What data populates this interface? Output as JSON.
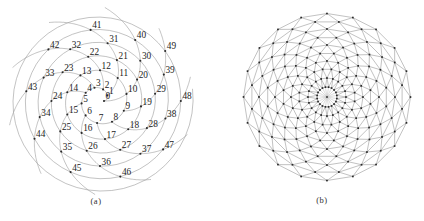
{
  "figure": {
    "colors": {
      "background": "#ffffff",
      "curve_line": "#9a9a9a",
      "mesh_line": "#909090",
      "spoke_line": "#b3b3b3",
      "dot": "#2a2a2a",
      "label_text": "#1b1b1b",
      "caption_text": "#2f2f2f"
    },
    "panel_a": {
      "caption": "(a)",
      "kind": "numbered-spiral-lattice",
      "n_points": 50,
      "labels": [
        "0",
        "1",
        "2",
        "3",
        "4",
        "5",
        "6",
        "7",
        "8",
        "9",
        "10",
        "11",
        "12",
        "13",
        "14",
        "15",
        "16",
        "17",
        "18",
        "19",
        "20",
        "21",
        "22",
        "23",
        "24",
        "25",
        "26",
        "27",
        "28",
        "29",
        "30",
        "31",
        "32",
        "33",
        "34",
        "35",
        "36",
        "37",
        "38",
        "39",
        "40",
        "41",
        "42",
        "43",
        "44",
        "45",
        "46",
        "47",
        "48",
        "49"
      ],
      "divergence_deg": 37.5,
      "center": [
        100,
        101
      ],
      "radius_coeffs": {
        "const": 4,
        "sqrt": 4.3,
        "linear": 0.98
      },
      "generative_spiral_t_end": 58,
      "parastichy_step": 10,
      "parastichy_angle_per_step_deg": 15
    },
    "panel_b": {
      "caption": "(b)",
      "kind": "triangulated-ring-mesh",
      "center": [
        327,
        97
      ],
      "rings": 10,
      "points_per_ring": 20,
      "ring_radii": [
        10,
        19,
        28,
        36,
        44,
        52,
        60,
        68,
        76,
        83.5
      ],
      "twist_per_ring_deg": 9,
      "has_center_node": true,
      "center_spokes": 20
    }
  }
}
